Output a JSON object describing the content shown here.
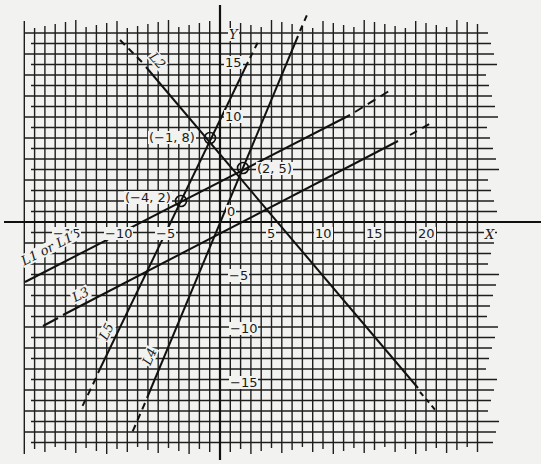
{
  "chart_data": {
    "type": "line",
    "title": "",
    "xlabel": "X",
    "ylabel": "Y",
    "xlim": [
      -20,
      25
    ],
    "ylim": [
      -20,
      20
    ],
    "grid": true,
    "x_ticks": [
      "-15",
      "-10",
      "-5",
      "5",
      "10",
      "15",
      "20"
    ],
    "y_ticks": [
      "15",
      "10",
      "0",
      "-5",
      "-10",
      "-15"
    ],
    "origin_label": "0",
    "series": [
      {
        "name": "L1 or L1'",
        "equation": "y = 0.5x + 4",
        "points": [
          [
            -20,
            -6
          ],
          [
            -4,
            2
          ],
          [
            2,
            5
          ],
          [
            13,
            10.5
          ]
        ],
        "style": "solid, dashed extension"
      },
      {
        "name": "L2",
        "equation": "y = -x + 7",
        "points": [
          [
            -10,
            17
          ],
          [
            -1,
            8
          ],
          [
            2,
            5
          ],
          [
            20,
            -13
          ]
        ],
        "style": "solid, dashed ends"
      },
      {
        "name": "L3",
        "equation": "y = 0.5x - 2",
        "points": [
          [
            -17,
            -10
          ],
          [
            4,
            0
          ],
          [
            21,
            9
          ]
        ],
        "style": "solid, dashed ends"
      },
      {
        "name": "L4",
        "equation": "y = 2.4x + 0.2",
        "points": [
          [
            -8,
            -20
          ],
          [
            2,
            5
          ],
          [
            8,
            19
          ]
        ],
        "style": "solid, dashed ends"
      },
      {
        "name": "L5",
        "equation": "y = 2x + 10",
        "points": [
          [
            -13,
            -17
          ],
          [
            -4,
            2
          ],
          [
            -1,
            8
          ],
          [
            3,
            17
          ]
        ],
        "style": "solid, dashed ends"
      }
    ],
    "annotations": [
      {
        "label": "(-1, 8)",
        "x": -1,
        "y": 8,
        "marker": "circle"
      },
      {
        "label": "(2, 5)",
        "x": 2,
        "y": 5,
        "marker": "circle"
      },
      {
        "label": "(-4, 2)",
        "x": -4,
        "y": 2,
        "marker": "circle"
      }
    ]
  },
  "labels": {
    "x_axis": "X",
    "y_axis": "Y",
    "origin": "0",
    "xticks": [
      "−15",
      "−10",
      "−5",
      "5",
      "10",
      "15",
      "20"
    ],
    "yticks": [
      "15",
      "10",
      "−5",
      "−10",
      "−15"
    ],
    "points": [
      "(−1, 8)",
      "(2, 5)",
      "(−4, 2)"
    ],
    "lines": [
      "L1 or L1′",
      "L2",
      "L3",
      "L4",
      "L5"
    ]
  }
}
